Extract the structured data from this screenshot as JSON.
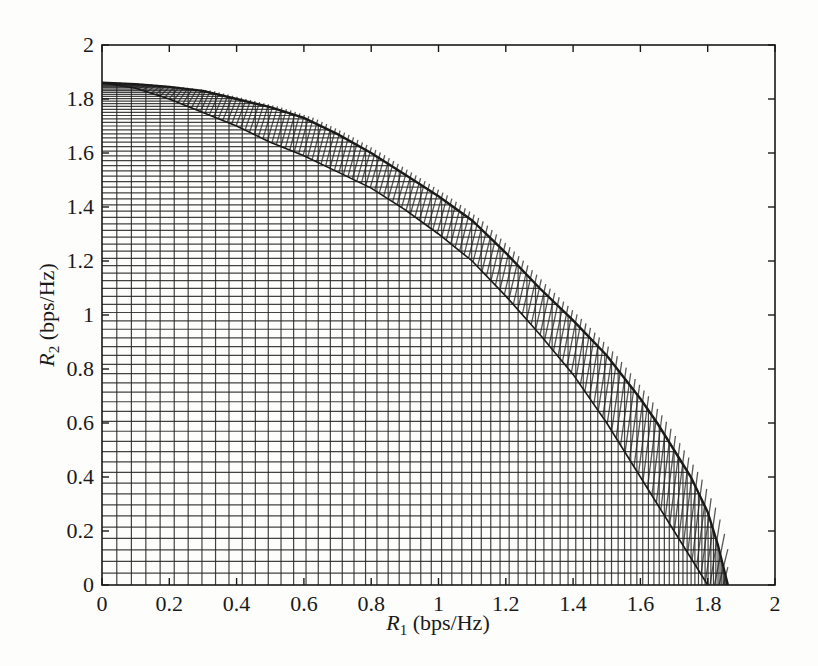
{
  "chart_data": {
    "type": "area",
    "title": "",
    "xlabel": "R1 (bps/Hz)",
    "xlabel_var": "R",
    "xlabel_sub": "1",
    "xlabel_unit": " (bps/Hz)",
    "ylabel": "R2 (bps/Hz)",
    "ylabel_var": "R",
    "ylabel_sub": "2",
    "ylabel_unit": " (bps/Hz)",
    "xlim": [
      0,
      2
    ],
    "ylim": [
      0,
      2
    ],
    "xticks": [
      "0",
      "0.2",
      "0.4",
      "0.6",
      "0.8",
      "1",
      "1.2",
      "1.4",
      "1.6",
      "1.8",
      "2"
    ],
    "yticks": [
      "0",
      "0.2",
      "0.4",
      "0.6",
      "0.8",
      "1",
      "1.2",
      "1.4",
      "1.6",
      "1.8",
      "2"
    ],
    "grid": false,
    "legend": null,
    "series": [
      {
        "name": "outer boundary",
        "x": [
          0,
          0.1,
          0.2,
          0.3,
          0.4,
          0.5,
          0.6,
          0.7,
          0.8,
          0.9,
          1.0,
          1.1,
          1.2,
          1.3,
          1.4,
          1.5,
          1.6,
          1.65,
          1.7,
          1.75,
          1.8,
          1.83,
          1.86
        ],
        "y": [
          1.86,
          1.855,
          1.845,
          1.83,
          1.8,
          1.77,
          1.73,
          1.67,
          1.6,
          1.52,
          1.44,
          1.35,
          1.23,
          1.1,
          0.98,
          0.85,
          0.69,
          0.6,
          0.5,
          0.4,
          0.27,
          0.15,
          0
        ]
      },
      {
        "name": "inner band boundary",
        "x": [
          0,
          0.1,
          0.2,
          0.3,
          0.4,
          0.5,
          0.6,
          0.7,
          0.8,
          0.9,
          1.0,
          1.1,
          1.2,
          1.3,
          1.4,
          1.5,
          1.6,
          1.7,
          1.75,
          1.8
        ],
        "y": [
          1.86,
          1.84,
          1.8,
          1.75,
          1.7,
          1.64,
          1.59,
          1.53,
          1.47,
          1.39,
          1.3,
          1.2,
          1.07,
          0.93,
          0.78,
          0.6,
          0.4,
          0.2,
          0.1,
          0
        ]
      }
    ],
    "mesh": {
      "horizontal_lines": 80,
      "vertical_lines": 80,
      "line_color": "#222222"
    }
  },
  "colors": {
    "ink": "#1a1a1a",
    "background": "#fdfdfb"
  }
}
